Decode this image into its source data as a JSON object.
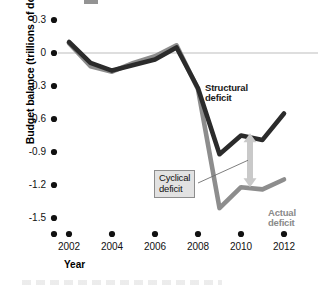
{
  "chart_data": {
    "type": "line",
    "title": "",
    "xlabel": "Year",
    "ylabel": "Budget balance (trillions of dollars)",
    "xlim": [
      2002,
      2012
    ],
    "ylim": [
      -1.5,
      0.3
    ],
    "grid": false,
    "zero_line": true,
    "legend_position": "inline-annotations",
    "x": [
      2002,
      2003,
      2004,
      2005,
      2006,
      2007,
      2008,
      2009,
      2010,
      2011,
      2012
    ],
    "series": [
      {
        "name": "Structural deficit",
        "color": "#2b2b2b",
        "values": [
          0.1,
          -0.09,
          -0.16,
          -0.11,
          -0.06,
          0.05,
          -0.32,
          -0.92,
          -0.75,
          -0.79,
          -0.55
        ]
      },
      {
        "name": "Actual deficit",
        "color": "#8d8d8d",
        "values": [
          0.09,
          -0.12,
          -0.17,
          -0.09,
          -0.03,
          0.07,
          -0.33,
          -1.41,
          -1.22,
          -1.24,
          -1.15
        ]
      }
    ],
    "yticks": [
      "0.3",
      "0",
      "-0.3",
      "-0.6",
      "-0.9",
      "-1.2",
      "-1.5"
    ],
    "ytick_values": [
      0.3,
      0,
      -0.3,
      -0.6,
      -0.9,
      -1.2,
      -1.5
    ],
    "xticks": [
      "2002",
      "2004",
      "2006",
      "2008",
      "2010",
      "2012"
    ],
    "xtick_values": [
      2002,
      2004,
      2006,
      2008,
      2010,
      2012
    ],
    "annotations": [
      {
        "name": "structural-deficit",
        "text_line1": "Structural",
        "text_line2": "deficit",
        "color": "#1a1a1a"
      },
      {
        "name": "actual-deficit",
        "text_line1": "Actual",
        "text_line2": "deficit",
        "color": "#8a8a8a"
      },
      {
        "name": "cyclical-deficit",
        "text_line1": "Cyclical",
        "text_line2": "deficit",
        "color": "#111111",
        "box_fill": "#e2e2e2",
        "box_border": "#8d8d8d",
        "arrow_color": "#c9c9c9",
        "arrow_at_year": 2010,
        "arrow_from": -0.73,
        "arrow_to": -1.22
      }
    ]
  },
  "axes": {
    "y_label": "Budget balance (trillions of dollars)",
    "x_label": "Year",
    "y_tick_labels": [
      "0.3",
      "0",
      "-0.3",
      "-0.6",
      "-0.9",
      "-1.2",
      "-1.5"
    ],
    "x_tick_labels": [
      "2002",
      "2004",
      "2006",
      "2008",
      "2010",
      "2012"
    ]
  },
  "annotations": {
    "structural": {
      "line1": "Structural",
      "line2": "deficit"
    },
    "actual": {
      "line1": "Actual",
      "line2": "deficit"
    },
    "cyclical": {
      "line1": "Cyclical",
      "line2": "deficit"
    }
  },
  "colors": {
    "structural_line": "#2b2b2b",
    "actual_line": "#8d8d8d",
    "zero_line": "#bdbdbd",
    "arrow": "#c9c9c9",
    "tick_dot": "#111111"
  }
}
